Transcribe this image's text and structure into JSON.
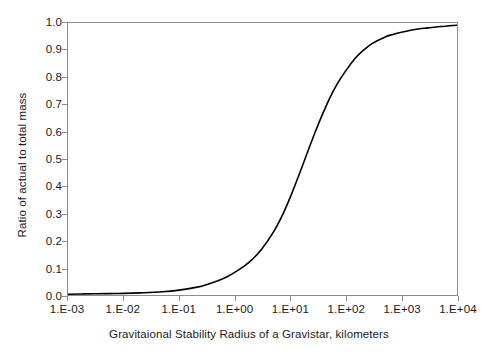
{
  "chart_data": {
    "type": "line",
    "title": "",
    "subtitle": "",
    "xlabel": "Gravitaional Stability Radius of a Gravistar, kilometers",
    "ylabel": "Ratio of actual to total mass",
    "x_scale": "log",
    "xlim": [
      0.001,
      10000
    ],
    "ylim": [
      0.0,
      1.0
    ],
    "grid": false,
    "legend": false,
    "legend_position": "none",
    "line_color": "#000000",
    "axis_color": "#8c8c8c",
    "background_color": "#ffffff",
    "x_tick_labels": [
      "1.E-03",
      "1.E-02",
      "1.E-01",
      "1.E+00",
      "1.E+01",
      "1.E+02",
      "1.E+03",
      "1.E+04"
    ],
    "x_tick_values": [
      0.001,
      0.01,
      0.1,
      1,
      10,
      100,
      1000,
      10000
    ],
    "y_tick_labels": [
      "0.0",
      "0.1",
      "0.2",
      "0.3",
      "0.4",
      "0.5",
      "0.6",
      "0.7",
      "0.8",
      "0.9",
      "1.0"
    ],
    "y_tick_values": [
      0.0,
      0.1,
      0.2,
      0.3,
      0.4,
      0.5,
      0.6,
      0.7,
      0.8,
      0.9,
      1.0
    ],
    "series": [
      {
        "name": "Ratio of actual to total mass",
        "x": [
          0.001,
          0.002,
          0.005,
          0.01,
          0.02,
          0.05,
          0.1,
          0.2,
          0.3,
          0.5,
          0.7,
          1,
          1.5,
          2,
          3,
          5,
          7,
          10,
          15,
          20,
          30,
          50,
          70,
          100,
          150,
          200,
          300,
          500,
          700,
          1000,
          2000,
          3000,
          5000,
          10000
        ],
        "y": [
          0.003,
          0.004,
          0.005,
          0.006,
          0.008,
          0.012,
          0.018,
          0.028,
          0.037,
          0.052,
          0.065,
          0.083,
          0.107,
          0.128,
          0.166,
          0.232,
          0.288,
          0.36,
          0.452,
          0.52,
          0.614,
          0.719,
          0.776,
          0.825,
          0.872,
          0.897,
          0.925,
          0.948,
          0.958,
          0.966,
          0.978,
          0.982,
          0.987,
          0.992
        ]
      }
    ]
  },
  "axes": {
    "x_title": "Gravitaional Stability Radius of a Gravistar, kilometers",
    "y_title": "Ratio of actual to total mass"
  }
}
